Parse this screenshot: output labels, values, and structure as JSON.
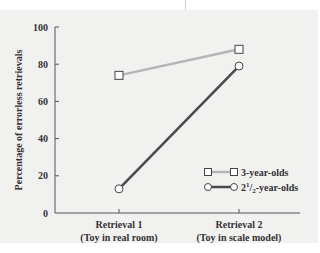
{
  "chart_data": {
    "type": "line",
    "title": "",
    "xlabel": "",
    "ylabel": "Percentage of errorless retrievals",
    "ylim": [
      0,
      100
    ],
    "yticks": [
      0,
      20,
      40,
      60,
      80,
      100
    ],
    "ytick_labels": [
      "0",
      "20",
      "40",
      "60",
      "80",
      "100"
    ],
    "grid": false,
    "legend_position": "lower right",
    "categories": [
      {
        "line1": "Retrieval 1",
        "line2": "(Toy in real room)"
      },
      {
        "line1": "Retrieval 2",
        "line2": "(Toy in scale model)"
      }
    ],
    "series": [
      {
        "name": "3-year-olds",
        "marker": "square",
        "color": "#b5b5b5",
        "values": [
          74,
          88
        ]
      },
      {
        "name": "2½-year-olds",
        "name_parts": {
          "whole": "2",
          "num": "1",
          "den": "2",
          "suffix": "-year-olds"
        },
        "marker": "circle",
        "color": "#4a4a4a",
        "values": [
          13,
          79
        ]
      }
    ]
  },
  "colors": {
    "panel_bg": "#f1f1f0",
    "axis": "#555555",
    "text": "#333333"
  }
}
